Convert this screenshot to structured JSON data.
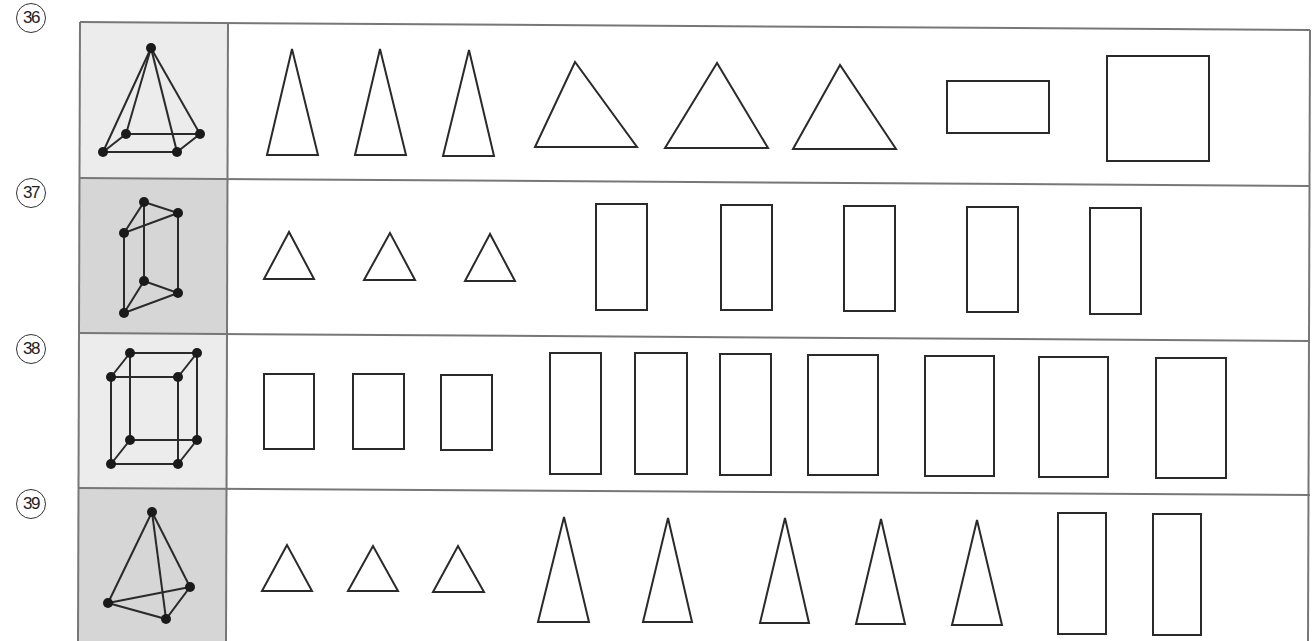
{
  "problems": [
    {
      "number": "36",
      "solid": "square-pyramid",
      "solid_cell_bg": "#ececec",
      "faces": [
        "tall-triangle",
        "tall-triangle",
        "tall-triangle",
        "triangle",
        "triangle",
        "triangle",
        "rectangle-wide",
        "square"
      ]
    },
    {
      "number": "37",
      "solid": "triangular-prism",
      "solid_cell_bg": "#d8d8d8",
      "faces": [
        "small-triangle",
        "small-triangle",
        "small-triangle",
        "tall-rectangle",
        "tall-rectangle",
        "tall-rectangle",
        "tall-rectangle",
        "tall-rectangle"
      ]
    },
    {
      "number": "38",
      "solid": "rectangular-prism",
      "solid_cell_bg": "#ececec",
      "faces": [
        "small-rectangle",
        "small-rectangle",
        "small-rectangle",
        "tall-rectangle",
        "tall-rectangle",
        "tall-rectangle",
        "rectangle",
        "rectangle",
        "rectangle",
        "rectangle"
      ]
    },
    {
      "number": "39",
      "solid": "triangular-pyramid",
      "solid_cell_bg": "#d8d8d8",
      "faces": [
        "small-triangle",
        "small-triangle",
        "small-triangle",
        "tall-triangle",
        "tall-triangle",
        "tall-triangle",
        "tall-triangle",
        "tall-triangle",
        "tall-rectangle",
        "tall-rectangle"
      ]
    }
  ],
  "colors": {
    "stroke": "#2a2a2a",
    "border": "#777777"
  }
}
